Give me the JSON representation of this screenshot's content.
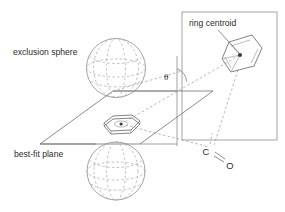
{
  "figure": {
    "background_color": "#ffffff",
    "line_color": "#6e6e6e",
    "dash_color": "#a0a0a0"
  },
  "labels": {
    "exclusion_sphere": "exclusion sphere",
    "best_fit_plane": "best-fit plane",
    "ring_centroid": "ring centroid",
    "theta": "θ",
    "carbon": "C",
    "oxygen": "O"
  },
  "elements": {
    "upper_sphere_name": "exclusion-sphere-upper",
    "lower_sphere_name": "exclusion-sphere-lower",
    "plane_name": "best-fit-plane",
    "inset_box_name": "ring-detail-box",
    "benzene_name": "benzene-ring",
    "planar_ring_name": "planar-ring",
    "carbonyl_name": "carbonyl-group"
  },
  "geometry": {
    "sphere_upper": {
      "cx": 116,
      "cy": 68,
      "r": 29.5
    },
    "sphere_lower": {
      "cx": 116,
      "cy": 171,
      "r": 29.0
    },
    "plane_corners": "40,144 113,91 213,91 140,144",
    "inset_box": {
      "x": 182,
      "y": 12,
      "w": 95,
      "h": 128
    },
    "ring_centroid_dot": {
      "cx": 240,
      "cy": 55
    },
    "planar_ring_dot": {
      "cx": 121,
      "cy": 124
    },
    "carbon_pos": {
      "x": 211,
      "y": 151
    },
    "oxygen_pos": {
      "x": 228,
      "y": 163
    },
    "theta_pos": {
      "x": 164,
      "y": 80
    }
  }
}
